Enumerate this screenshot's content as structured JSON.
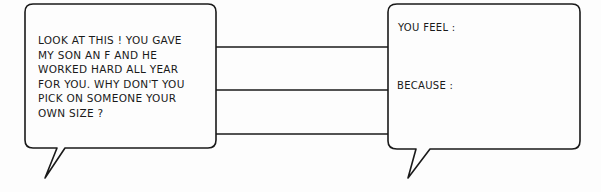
{
  "left_bubble": {
    "lines": [
      "LOOK AT THIS ! YOU GAVE",
      "MY SON AN F AND HE",
      "WORKED HARD ALL YEAR",
      "FOR YOU. WHY DON'T YOU",
      "PICK ON SOMEONE YOUR",
      "OWN SIZE ?"
    ]
  },
  "right_bubble": {
    "prompt_feel": "YOU FEEL :",
    "prompt_because": "BECAUSE :"
  },
  "colors": {
    "stroke": "#1a1a1a",
    "background": "#fdfdfd"
  }
}
